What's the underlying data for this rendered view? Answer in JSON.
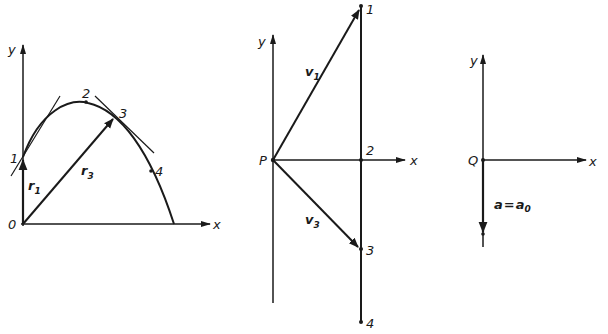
{
  "diagram": {
    "panel_position": {
      "axis_x": "x",
      "axis_y": "y",
      "origin": "0",
      "points": [
        "1",
        "2",
        "3",
        "4"
      ],
      "vector_1": {
        "sym": "r",
        "sub": "1"
      },
      "vector_3": {
        "sym": "r",
        "sub": "3"
      }
    },
    "panel_velocity": {
      "axis_x": "x",
      "axis_y": "y",
      "origin": "P",
      "points": [
        "1",
        "2",
        "3",
        "4"
      ],
      "vector_1": {
        "sym": "v",
        "sub": "1"
      },
      "vector_3": {
        "sym": "v",
        "sub": "3"
      }
    },
    "panel_acceleration": {
      "axis_x": "x",
      "axis_y": "y",
      "origin": "Q",
      "equation": {
        "lhs": "a",
        "eq": "=",
        "rhs": "a",
        "rhs_sub": "0"
      }
    },
    "colors": {
      "ink": "#1a1a1a",
      "background": "#ffffff"
    }
  }
}
